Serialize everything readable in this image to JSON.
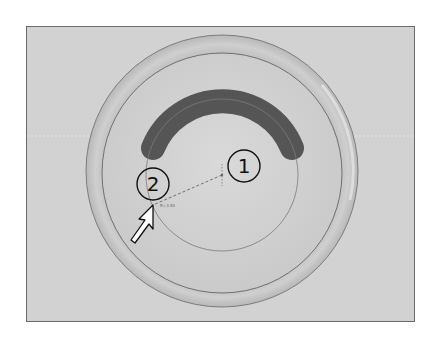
{
  "figure": {
    "background_color": "#d2d2d2",
    "frame_color": "#6a6a6a",
    "dish": {
      "center": [
        222,
        171
      ],
      "outer_radius": 136,
      "inner_radius": 120,
      "outer_color": "#c4c4c4",
      "inner_color": "#d6d6d6"
    },
    "arc": {
      "center": [
        222,
        175
      ],
      "radius": 75,
      "thickness": 24,
      "color": "#555555"
    },
    "construction_circle": {
      "center": [
        222,
        175
      ],
      "radius": 76,
      "color": "#7a7a7a"
    },
    "callouts": [
      {
        "label": "1",
        "x": 244,
        "y": 166
      },
      {
        "label": "2",
        "x": 153,
        "y": 184
      }
    ],
    "cursor_tooltip": "R=3.50",
    "cursor_icon": "arrow-pointer-icon"
  }
}
